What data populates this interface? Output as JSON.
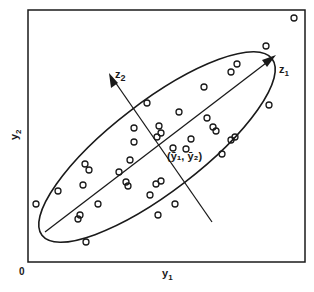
{
  "diagram": {
    "labels": {
      "x_axis": "y",
      "x_axis_sub": "1",
      "y_axis": "y",
      "y_axis_sub": "2",
      "origin": "0",
      "major_axis": "z",
      "major_axis_sub": "1",
      "minor_axis": "z",
      "minor_axis_sub": "2",
      "centroid": "(ȳ₁, ȳ₂)"
    },
    "colors": {
      "ink": "#1a1a1a",
      "background": "#ffffff"
    },
    "frame": {
      "x": 28,
      "y": 10,
      "width": 277,
      "height": 252
    },
    "ellipse": {
      "cx": 157,
      "cy": 147,
      "rx": 145,
      "ry": 45,
      "rotation_deg": -37.5
    },
    "major_axis_line": {
      "x1": 45,
      "y1": 232,
      "x2": 272,
      "y2": 58
    },
    "minor_axis_line": {
      "x1": 212,
      "y1": 222,
      "x2": 110,
      "y2": 75
    },
    "points": [
      [
        294,
        18
      ],
      [
        266,
        46
      ],
      [
        237,
        64
      ],
      [
        231,
        72
      ],
      [
        204,
        87
      ],
      [
        269,
        105
      ],
      [
        147,
        103
      ],
      [
        179,
        112
      ],
      [
        134,
        128
      ],
      [
        134,
        142
      ],
      [
        159,
        126
      ],
      [
        161,
        133
      ],
      [
        157,
        137
      ],
      [
        207,
        118
      ],
      [
        213,
        127
      ],
      [
        216,
        131
      ],
      [
        231,
        140
      ],
      [
        235,
        137
      ],
      [
        222,
        154
      ],
      [
        191,
        139
      ],
      [
        173,
        148
      ],
      [
        186,
        149
      ],
      [
        85,
        164
      ],
      [
        89,
        170
      ],
      [
        83,
        185
      ],
      [
        119,
        172
      ],
      [
        58,
        191
      ],
      [
        36,
        204
      ],
      [
        98,
        204
      ],
      [
        78,
        219
      ],
      [
        80,
        215
      ],
      [
        86,
        242
      ],
      [
        158,
        215
      ],
      [
        150,
        195
      ],
      [
        156,
        184
      ],
      [
        161,
        181
      ],
      [
        175,
        204
      ],
      [
        130,
        160
      ],
      [
        126,
        182
      ],
      [
        128,
        186
      ]
    ]
  }
}
